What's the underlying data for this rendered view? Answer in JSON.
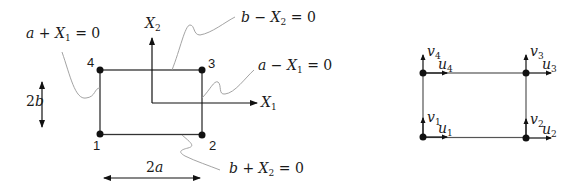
{
  "left_diagram": {
    "nodes": [
      {
        "id": "1",
        "label": "1"
      },
      {
        "id": "2",
        "label": "2"
      },
      {
        "id": "3",
        "label": "3"
      },
      {
        "id": "4",
        "label": "4"
      }
    ],
    "axes": {
      "x": {
        "base": "X",
        "sub": "1"
      },
      "y": {
        "base": "X",
        "sub": "2"
      }
    },
    "boundaries": {
      "left": {
        "pre": "a + ",
        "var": "X",
        "sub": "1",
        "post": " = 0"
      },
      "top": {
        "pre": "b − ",
        "var": "X",
        "sub": "2",
        "post": " = 0"
      },
      "right": {
        "pre": "a − ",
        "var": "X",
        "sub": "1",
        "post": " = 0"
      },
      "bottom": {
        "pre": "b + ",
        "var": "X",
        "sub": "2",
        "post": " = 0"
      }
    },
    "dimensions": {
      "height": {
        "num": "2",
        "var": "b"
      },
      "width": {
        "num": "2",
        "var": "a"
      }
    }
  },
  "right_diagram": {
    "dofs": [
      {
        "node": "1",
        "u": {
          "base": "u",
          "sub": "1"
        },
        "v": {
          "base": "v",
          "sub": "1"
        }
      },
      {
        "node": "2",
        "u": {
          "base": "u",
          "sub": "2"
        },
        "v": {
          "base": "v",
          "sub": "2"
        }
      },
      {
        "node": "3",
        "u": {
          "base": "u",
          "sub": "3"
        },
        "v": {
          "base": "v",
          "sub": "3"
        }
      },
      {
        "node": "4",
        "u": {
          "base": "u",
          "sub": "4"
        },
        "v": {
          "base": "v",
          "sub": "4"
        }
      }
    ]
  }
}
